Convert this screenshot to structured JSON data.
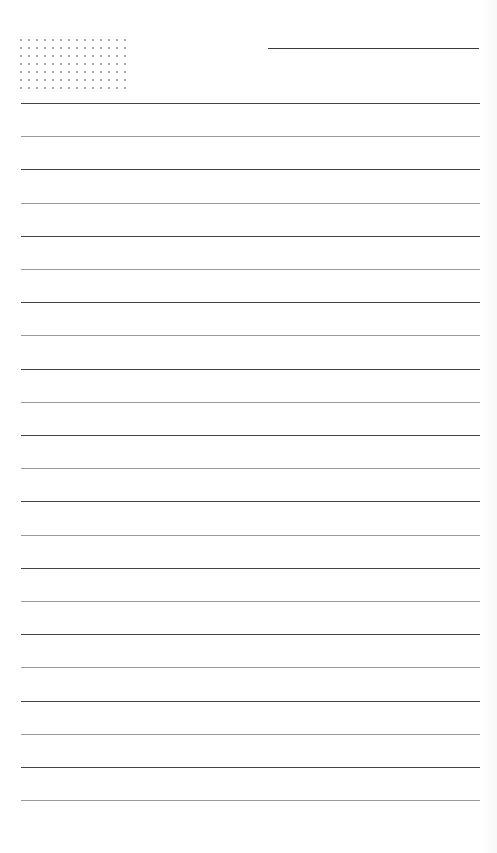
{
  "page": {
    "type": "lined-notebook-page",
    "background_color": "#ffffff",
    "line_color": "#6e6e6e",
    "dot_color": "#8a8a8a"
  },
  "header": {
    "dot_grid": {
      "columns": 14,
      "rows": 7
    },
    "title_line": {
      "visible": true
    }
  },
  "ruled_lines": {
    "count": 22,
    "first_y": 103,
    "spacing": 33.2
  }
}
